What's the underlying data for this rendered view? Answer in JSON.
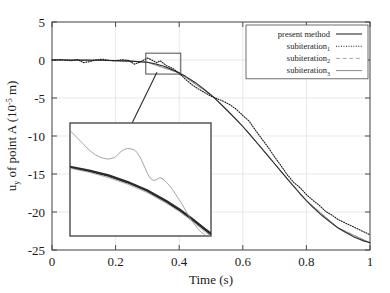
{
  "chart_data": {
    "type": "line",
    "title": "",
    "xlabel": "Time (s)",
    "ylabel_parts": {
      "main": "u",
      "sub": "y",
      "rest": " of point A (10",
      "exp": "-5",
      "tail": " m)"
    },
    "ylabel": "u_y of point A (10^-5 m)",
    "xlim": [
      0,
      1
    ],
    "ylim": [
      -25,
      5
    ],
    "xticks": [
      "0",
      "0.2",
      "0.4",
      "0.6",
      "0.8",
      "1"
    ],
    "xtick_values": [
      0,
      0.2,
      0.4,
      0.6,
      0.8,
      1
    ],
    "yticks": [
      "5",
      "0",
      "-5",
      "-10",
      "-15",
      "-20",
      "-25"
    ],
    "ytick_values": [
      5,
      0,
      -5,
      -10,
      -15,
      -20,
      -25
    ],
    "grid": true,
    "legend_position": "top-right",
    "series": [
      {
        "name": "present method",
        "style": "solid",
        "color": "#2b2b2b",
        "width": 1.1,
        "x": [
          0,
          0.05,
          0.1,
          0.15,
          0.2,
          0.25,
          0.3,
          0.32,
          0.35,
          0.38,
          0.4,
          0.42,
          0.45,
          0.48,
          0.5,
          0.52,
          0.55,
          0.58,
          0.6,
          0.62,
          0.65,
          0.68,
          0.7,
          0.72,
          0.75,
          0.78,
          0.8,
          0.82,
          0.85,
          0.88,
          0.9,
          0.92,
          0.95,
          0.98,
          1.0
        ],
        "y": [
          0,
          0,
          -0.02,
          -0.04,
          -0.08,
          -0.15,
          -0.3,
          -0.45,
          -0.8,
          -1.3,
          -1.7,
          -2.15,
          -2.95,
          -3.9,
          -4.6,
          -5.35,
          -6.55,
          -7.85,
          -8.75,
          -9.7,
          -11.15,
          -12.65,
          -13.65,
          -14.65,
          -16.15,
          -17.6,
          -18.5,
          -19.35,
          -20.5,
          -21.5,
          -22.1,
          -22.6,
          -23.3,
          -23.8,
          -24.05
        ]
      },
      {
        "name": "subiteration_1",
        "style": "dotted",
        "color": "#1a1a1a",
        "width": 1.1,
        "x": [
          0,
          0.03,
          0.06,
          0.08,
          0.1,
          0.12,
          0.14,
          0.16,
          0.18,
          0.2,
          0.22,
          0.24,
          0.26,
          0.28,
          0.3,
          0.31,
          0.32,
          0.33,
          0.34,
          0.36,
          0.38,
          0.4,
          0.42,
          0.44,
          0.46,
          0.48,
          0.5,
          0.52,
          0.54,
          0.56,
          0.58,
          0.6,
          0.62,
          0.64,
          0.66,
          0.68,
          0.7,
          0.72,
          0.74,
          0.76,
          0.78,
          0.8,
          0.82,
          0.84,
          0.86,
          0.88,
          0.9,
          0.92,
          0.94,
          0.96,
          0.98,
          1.0
        ],
        "y": [
          0,
          0.05,
          -0.1,
          0.05,
          -0.35,
          -0.2,
          0.05,
          0.1,
          -0.05,
          -0.1,
          0.05,
          -0.05,
          -0.55,
          -0.2,
          0.25,
          0.1,
          -0.15,
          -0.35,
          -0.1,
          -0.75,
          -1.1,
          -1.75,
          -2.55,
          -3.25,
          -3.8,
          -4.3,
          -4.75,
          -5.1,
          -5.45,
          -5.9,
          -6.5,
          -7.3,
          -8.05,
          -9.25,
          -10.4,
          -11.5,
          -12.75,
          -13.9,
          -15.1,
          -16.1,
          -16.8,
          -17.7,
          -18.45,
          -19.1,
          -19.9,
          -20.4,
          -21.0,
          -21.4,
          -21.8,
          -22.2,
          -22.6,
          -23.0
        ]
      },
      {
        "name": "subiteration_2",
        "style": "dashed",
        "color": "#a8a8a8",
        "width": 0.9,
        "x": [
          0,
          0.1,
          0.2,
          0.3,
          0.4,
          0.5,
          0.6,
          0.7,
          0.8,
          0.9,
          1.0
        ],
        "y": [
          0,
          -0.02,
          -0.08,
          -0.3,
          -1.7,
          -4.6,
          -8.75,
          -13.65,
          -18.5,
          -22.1,
          -24.05
        ]
      },
      {
        "name": "subiteration_3",
        "style": "solid",
        "color": "#8a8a8a",
        "width": 0.9,
        "x": [
          0,
          0.1,
          0.2,
          0.3,
          0.4,
          0.5,
          0.6,
          0.7,
          0.8,
          0.9,
          1.0
        ],
        "y": [
          0,
          -0.02,
          -0.08,
          -0.3,
          -1.7,
          -4.6,
          -8.75,
          -13.65,
          -18.5,
          -22.1,
          -24.05
        ]
      }
    ],
    "annotations": {
      "source_box": {
        "x0": 0.295,
        "x1": 0.405,
        "y0": 0.9,
        "y1": -1.85
      },
      "arrow": {
        "from_x": 0.33,
        "from_y": -1.6,
        "to_x": 0.205,
        "to_y": -12.3
      },
      "inset": {
        "xlim": [
          0.295,
          0.405
        ],
        "ylim": [
          -1.85,
          0.9
        ],
        "series": [
          {
            "name": "present method",
            "style": "solid",
            "color": "#2b2b2b",
            "width": 2.6,
            "x": [
              0.295,
              0.31,
              0.325,
              0.34,
              0.355,
              0.37,
              0.38,
              0.39,
              0.4,
              0.405
            ],
            "y": [
              -0.17,
              -0.26,
              -0.38,
              -0.54,
              -0.74,
              -1.0,
              -1.2,
              -1.43,
              -1.68,
              -1.8
            ]
          },
          {
            "name": "subiteration_2",
            "style": "solid",
            "color": "#9a9a9a",
            "width": 0.8,
            "x": [
              0.295,
              0.31,
              0.325,
              0.34,
              0.355,
              0.37,
              0.38,
              0.39,
              0.4,
              0.405
            ],
            "y": [
              -0.2,
              -0.3,
              -0.43,
              -0.59,
              -0.79,
              -1.05,
              -1.25,
              -1.48,
              -1.74,
              -1.86
            ]
          },
          {
            "name": "subiteration_1",
            "style": "solid",
            "color": "#8e8e8e",
            "width": 0.8,
            "x": [
              0.295,
              0.3,
              0.305,
              0.31,
              0.315,
              0.32,
              0.325,
              0.33,
              0.3325,
              0.335,
              0.3375,
              0.34,
              0.3425,
              0.345,
              0.3475,
              0.35,
              0.3525,
              0.355,
              0.3575,
              0.36,
              0.3625,
              0.365,
              0.3675,
              0.37,
              0.3725,
              0.375,
              0.3775,
              0.38,
              0.3825,
              0.385,
              0.3875,
              0.39,
              0.3925,
              0.395,
              0.3975,
              0.4,
              0.4025,
              0.405
            ],
            "y": [
              0.72,
              0.56,
              0.4,
              0.24,
              0.12,
              0.05,
              0.02,
              0.06,
              0.14,
              0.21,
              0.26,
              0.28,
              0.27,
              0.25,
              0.18,
              0.05,
              -0.12,
              -0.3,
              -0.44,
              -0.5,
              -0.48,
              -0.43,
              -0.46,
              -0.54,
              -0.62,
              -0.72,
              -0.84,
              -0.96,
              -1.08,
              -1.22,
              -1.36,
              -1.48,
              -1.58,
              -1.68,
              -1.76,
              -1.82,
              -1.86,
              -1.88
            ]
          }
        ]
      }
    }
  },
  "legend": {
    "entries": [
      {
        "label": "present method",
        "sub": ""
      },
      {
        "label": "subiteration",
        "sub": "1"
      },
      {
        "label": "subiteration",
        "sub": "2"
      },
      {
        "label": "subiteration",
        "sub": "3"
      }
    ]
  }
}
